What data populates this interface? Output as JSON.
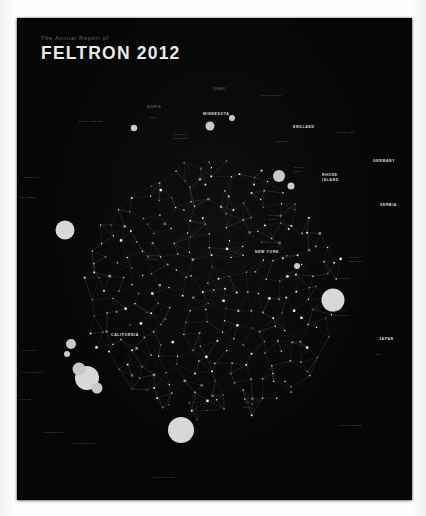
{
  "poster": {
    "background_color": "#060606",
    "page_color": "#fdfdfd",
    "header": {
      "kicker": "The Annual Report of",
      "title": "FELTRON 2012"
    }
  },
  "chart_data": {
    "type": "scatter",
    "title": "FELTRON 2012",
    "subtitle": "The Annual Report of",
    "xlabel": "",
    "ylabel": "",
    "grid": false,
    "legend_position": "none",
    "layout": {
      "shape": "circle",
      "center_x": 197,
      "center_y": 212,
      "radius": 131,
      "node_count": 420,
      "edge_style": "delaunay-triangulation"
    },
    "colors": {
      "background": "#060606",
      "node": "#efefef",
      "edge": "#343434",
      "label": "#b9b9b9",
      "accent": "#e9e9e9"
    },
    "labels": [
      {
        "text": "QUEBEC",
        "x": 196,
        "y": 12,
        "size": "minor"
      },
      {
        "text": "Mount Tremblant",
        "x": 244,
        "y": 18,
        "size": "tiny"
      },
      {
        "text": "ALBERTA",
        "x": 130,
        "y": 30,
        "size": "minor"
      },
      {
        "text": "MINNESOTA",
        "x": 186,
        "y": 37,
        "size": "major"
      },
      {
        "text": "Banff",
        "x": 133,
        "y": 40,
        "size": "tiny"
      },
      {
        "text": "BRITISH COLUMBIA",
        "x": 62,
        "y": 44,
        "size": "tiny"
      },
      {
        "text": "ENGLAND",
        "x": 276,
        "y": 50,
        "size": "major"
      },
      {
        "text": "NETHERLANDS",
        "x": 318,
        "y": 55,
        "size": "tiny"
      },
      {
        "text": "Saint Paul",
        "x": 157,
        "y": 57,
        "size": "tiny"
      },
      {
        "text": "Minneapolis",
        "x": 157,
        "y": 61,
        "size": "tiny"
      },
      {
        "text": "Amsterdam",
        "x": 258,
        "y": 64,
        "size": "tiny"
      },
      {
        "text": "GERMANY",
        "x": 356,
        "y": 84,
        "size": "major"
      },
      {
        "text": "Munich",
        "x": 277,
        "y": 90,
        "size": "tiny"
      },
      {
        "text": "Berlin",
        "x": 277,
        "y": 94,
        "size": "tiny"
      },
      {
        "text": "RHODE",
        "x": 305,
        "y": 98,
        "size": "major"
      },
      {
        "text": "ISLAND",
        "x": 305,
        "y": 103,
        "size": "major"
      },
      {
        "text": "PENNSYLVANIA",
        "x": 6,
        "y": 100,
        "size": "tiny"
      },
      {
        "text": "SERBIA",
        "x": 363,
        "y": 128,
        "size": "major"
      },
      {
        "text": "NEW JERSEY",
        "x": 2,
        "y": 120,
        "size": "tiny"
      },
      {
        "text": "Providence",
        "x": 252,
        "y": 138,
        "size": "tiny"
      },
      {
        "text": "Bristol",
        "x": 252,
        "y": 142,
        "size": "tiny"
      },
      {
        "text": "NEW YORK",
        "x": 238,
        "y": 175,
        "size": "major"
      },
      {
        "text": "Jackson Hole",
        "x": 128,
        "y": 178,
        "size": "tiny"
      },
      {
        "text": "WYOMING",
        "x": 128,
        "y": 182,
        "size": "tiny"
      },
      {
        "text": "Cologne",
        "x": 332,
        "y": 180,
        "size": "tiny"
      },
      {
        "text": "Dusseldorf",
        "x": 332,
        "y": 184,
        "size": "tiny"
      },
      {
        "text": "Belgrade",
        "x": 322,
        "y": 201,
        "size": "tiny"
      },
      {
        "text": "CALIFORNIA",
        "x": 94,
        "y": 258,
        "size": "major"
      },
      {
        "text": "Brooklyn",
        "x": 318,
        "y": 233,
        "size": "tiny"
      },
      {
        "text": "Manhattan",
        "x": 318,
        "y": 238,
        "size": "tiny"
      },
      {
        "text": "JAPAN",
        "x": 362,
        "y": 262,
        "size": "major"
      },
      {
        "text": "Tokyo",
        "x": 358,
        "y": 277,
        "size": "tiny"
      },
      {
        "text": "SAN FRANCISCO",
        "x": 4,
        "y": 295,
        "size": "tiny"
      },
      {
        "text": "Los Angeles",
        "x": 4,
        "y": 273,
        "size": "tiny"
      },
      {
        "text": "OAKLAND",
        "x": 2,
        "y": 322,
        "size": "tiny"
      },
      {
        "text": "Kyoto",
        "x": 226,
        "y": 325,
        "size": "tiny"
      },
      {
        "text": "Osaka",
        "x": 226,
        "y": 330,
        "size": "tiny"
      },
      {
        "text": "MASSACHUSETTS",
        "x": 322,
        "y": 348,
        "size": "tiny"
      },
      {
        "text": "CONNECTICUT",
        "x": 28,
        "y": 355,
        "size": "tiny"
      },
      {
        "text": "WASHINGTON D.C.",
        "x": 56,
        "y": 366,
        "size": "tiny"
      },
      {
        "text": "SAN FRANCISCO",
        "x": 136,
        "y": 400,
        "size": "tiny"
      }
    ],
    "major_nodes": [
      {
        "label": "Los Angeles",
        "cx": 48,
        "cy": 152,
        "r": 9.5
      },
      {
        "label": "Oakland",
        "cx": 54,
        "cy": 266,
        "r": 5.0
      },
      {
        "label": "Berkeley",
        "cx": 50,
        "cy": 276,
        "r": 3.0
      },
      {
        "label": "San Francisco",
        "cx": 70,
        "cy": 300,
        "r": 12.0
      },
      {
        "label": "SF cluster a",
        "cx": 62,
        "cy": 291,
        "r": 6.5
      },
      {
        "label": "SF cluster b",
        "cx": 80,
        "cy": 310,
        "r": 5.5
      },
      {
        "label": "New York",
        "cx": 164,
        "cy": 352,
        "r": 13.0
      },
      {
        "label": "Tokyo",
        "cx": 316,
        "cy": 222,
        "r": 11.5
      },
      {
        "label": "Amsterdam",
        "cx": 262,
        "cy": 98,
        "r": 6.0
      },
      {
        "label": "Berlin",
        "cx": 274,
        "cy": 108,
        "r": 3.5
      },
      {
        "label": "Minneapolis",
        "cx": 193,
        "cy": 48,
        "r": 4.5
      },
      {
        "label": "Quebec",
        "cx": 215,
        "cy": 40,
        "r": 3.0
      },
      {
        "label": "Providence",
        "cx": 280,
        "cy": 188,
        "r": 3.0
      },
      {
        "label": "Vancouver",
        "cx": 117,
        "cy": 50,
        "r": 3.2
      }
    ]
  }
}
